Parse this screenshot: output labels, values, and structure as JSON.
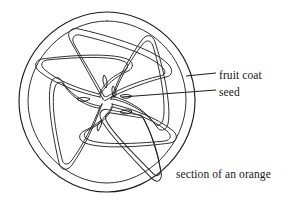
{
  "figure": {
    "kind": "botanical-line-drawing",
    "caption": "section of an orange",
    "background_color": "#ffffff",
    "ink_color": "#1c1c1c",
    "width": 298,
    "height": 212
  },
  "diagram": {
    "outer_circle": {
      "name": "fruit-coat-outer-edge",
      "center_x": 107,
      "center_y": 101,
      "radius": 89
    },
    "inner_circle": {
      "name": "fruit-coat-inner-edge",
      "center_x": 107,
      "center_y": 101,
      "radius": 80
    },
    "segment_count": 6,
    "segment_label": "orange wedge",
    "seed_count": 6,
    "seed_label": "seed"
  },
  "labels": [
    {
      "id": "fruit-coat",
      "text": "fruit coat",
      "leader_from_x": 186,
      "leader_from_y": 76,
      "leader_to_x": 216,
      "leader_to_y": 74
    },
    {
      "id": "seed",
      "text": "seed",
      "leader_from_x": 121,
      "leader_from_y": 97,
      "leader_to_x": 216,
      "leader_to_y": 91
    }
  ]
}
